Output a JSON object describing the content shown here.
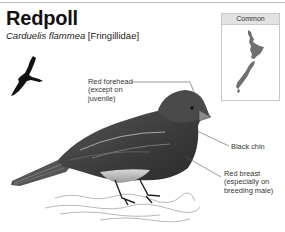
{
  "header": {
    "title": "Redpoll",
    "scientific_name": "Carduelis flammea",
    "family": "[Fringillidae]"
  },
  "distribution_map": {
    "status_label": "Common",
    "region": "New Zealand",
    "fill_color": "#6f6f6f"
  },
  "annotations": [
    {
      "id": "forehead",
      "lines": [
        "Red forehead",
        "(except on",
        "juvenile)"
      ]
    },
    {
      "id": "chin",
      "lines": [
        "Black chin"
      ]
    },
    {
      "id": "breast",
      "lines": [
        "Red breast",
        "(especially on",
        "breeding male)"
      ]
    }
  ],
  "icons": {
    "flight_silhouette": "flying-bird-silhouette",
    "illustration": "redpoll-bird-illustration"
  }
}
